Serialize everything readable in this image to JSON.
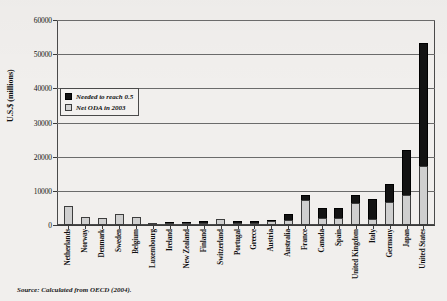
{
  "chart_data": {
    "type": "bar",
    "stacked": true,
    "title": "",
    "xlabel": "",
    "ylabel": "U.S.$ (millions)",
    "ylim": [
      0,
      60000
    ],
    "yticks": [
      0,
      10000,
      20000,
      30000,
      40000,
      50000,
      60000
    ],
    "ytick_labels": [
      "0",
      "10000",
      "20000",
      "30000",
      "40000",
      "50000",
      "60000"
    ],
    "grid": true,
    "legend_position": "upper-left-inside",
    "categories": [
      "Netherlands",
      "Norway",
      "Denmark",
      "Sweden",
      "Belgium",
      "Luxembourg",
      "Ireland",
      "New Zealand",
      "Finland",
      "Switzerland",
      "Portugal",
      "Greece",
      "Austria",
      "Australia",
      "France",
      "Canada",
      "Spain",
      "United Kingdom",
      "Italy",
      "Germany",
      "Japan",
      "United States"
    ],
    "series": [
      {
        "name": "Net ODA in 2003",
        "color": "#cfcfcf",
        "values": [
          5450,
          2350,
          2150,
          3200,
          2400,
          220,
          510,
          170,
          620,
          1700,
          650,
          650,
          1050,
          1550,
          7250,
          2050,
          2050,
          6350,
          1800,
          6650,
          8900,
          17300
        ]
      },
      {
        "name": "Needed to reach 0.5",
        "color": "#131313",
        "values": [
          0,
          0,
          0,
          0,
          0,
          0,
          100,
          80,
          200,
          0,
          100,
          150,
          350,
          1750,
          1550,
          3000,
          3000,
          2450,
          5750,
          5500,
          13100,
          36100
        ]
      }
    ],
    "annotations": {
      "source": "Source: Calculated from OECD (2004)."
    }
  },
  "legend": {
    "items": [
      {
        "label": "Needed to reach 0.5",
        "swatch": "black-swatch"
      },
      {
        "label": "Net ODA in 2003",
        "swatch": "gray-swatch"
      }
    ]
  }
}
